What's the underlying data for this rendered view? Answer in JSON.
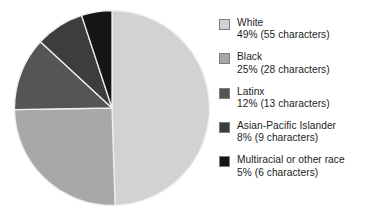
{
  "chart_data": {
    "type": "pie",
    "title": "",
    "subtitle": "",
    "xlabel": "",
    "ylabel": "",
    "legend_position": "right",
    "grid": false,
    "start_angle_clock": 12,
    "direction": "clockwise",
    "categories": [
      "White",
      "Black",
      "Latinx",
      "Asian-Pacific Islander",
      "Multiracial or other race"
    ],
    "values": [
      49,
      25,
      12,
      8,
      5
    ],
    "counts": [
      55,
      28,
      13,
      9,
      6
    ],
    "count_unit": "characters",
    "colors": [
      "#d2d2d2",
      "#a8a8a8",
      "#555555",
      "#3d3d3d",
      "#151515"
    ],
    "slices": [
      {
        "label": "White",
        "percent": 49,
        "percent_text": "49%",
        "count": 55,
        "value_text": "49% (55 characters)",
        "color": "#d2d2d2"
      },
      {
        "label": "Black",
        "percent": 25,
        "percent_text": "25%",
        "count": 28,
        "value_text": "25% (28 characters)",
        "color": "#a8a8a8"
      },
      {
        "label": "Latinx",
        "percent": 12,
        "percent_text": "12%",
        "count": 13,
        "value_text": "12% (13 characters)",
        "color": "#555555"
      },
      {
        "label": "Asian-Pacific Islander",
        "percent": 8,
        "percent_text": "8%",
        "count": 9,
        "value_text": "8% (9 characters)",
        "color": "#3d3d3d"
      },
      {
        "label": "Multiracial or other race",
        "percent": 5,
        "percent_text": "5%",
        "count": 6,
        "value_text": "5% (6 characters)",
        "color": "#151515"
      }
    ]
  },
  "legend": {
    "items": [
      {
        "label": "White",
        "value_text": "49% (55 characters)",
        "color": "#d2d2d2"
      },
      {
        "label": "Black",
        "value_text": "25% (28 characters)",
        "color": "#a8a8a8"
      },
      {
        "label": "Latinx",
        "value_text": "12% (13 characters)",
        "color": "#555555"
      },
      {
        "label": "Asian-Pacific Islander",
        "value_text": "8% (9 characters)",
        "color": "#3d3d3d"
      },
      {
        "label": "Multiracial or other race",
        "value_text": "5% (6 characters)",
        "color": "#151515"
      }
    ]
  },
  "style": {
    "background": "#ffffff",
    "text_color": "#1c1c1c",
    "slice_divider_color": "#efefef",
    "swatch_border_color": "#7d7d7d"
  }
}
